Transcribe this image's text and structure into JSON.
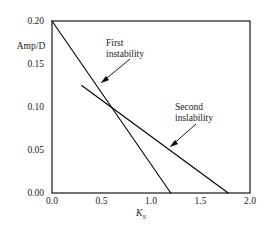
{
  "chart_data": {
    "type": "line",
    "title": "",
    "subtitle": "",
    "xlabel": "K_S",
    "xlabel_base": "K",
    "xlabel_sub": "S",
    "ylabel": "Amp/D",
    "xlim": [
      0.0,
      2.0
    ],
    "ylim": [
      0.0,
      0.2
    ],
    "xticks": [
      "0.0",
      "0.5",
      "1.0",
      "1.5",
      "2.0"
    ],
    "xtick_values": [
      0.0,
      0.5,
      1.0,
      1.5,
      2.0
    ],
    "yticks": [
      "0.00",
      "0.05",
      "0.10",
      "0.15",
      "0.20"
    ],
    "ytick_values": [
      0.0,
      0.05,
      0.1,
      0.15,
      0.2
    ],
    "grid": false,
    "legend": "none",
    "frame": "box",
    "series": [
      {
        "name": "First instability",
        "x": [
          0.0,
          1.2
        ],
        "values": [
          0.2,
          0.0
        ],
        "color": "#000000"
      },
      {
        "name": "Second inslability",
        "x": [
          0.3,
          1.78
        ],
        "values": [
          0.125,
          0.0
        ],
        "color": "#000000"
      }
    ],
    "annotations": [
      {
        "id": "first",
        "line1": "First",
        "line2": "instability",
        "target_x": 0.45,
        "target_y": 0.125
      },
      {
        "id": "second",
        "line1": "Second",
        "line2": "inslability",
        "target_x": 1.06,
        "target_y": 0.0545
      }
    ],
    "intersection": {
      "x": 0.6,
      "y": 0.1
    }
  },
  "colors": {
    "background": "#ffffff",
    "axis": "#000000",
    "line": "#000000",
    "text": "#1a1a1a"
  }
}
